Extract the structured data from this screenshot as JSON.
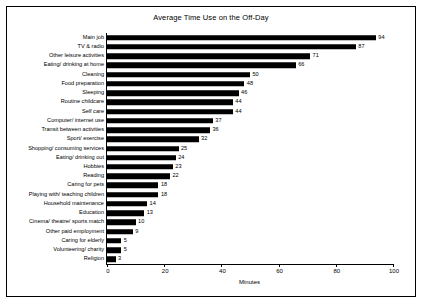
{
  "chart_data": {
    "type": "bar",
    "title": "Average Time Use on the Off-Day",
    "xlabel": "Minutes",
    "ylabel": "",
    "orientation": "horizontal",
    "xlim": [
      0,
      100
    ],
    "xticks": [
      0,
      20,
      40,
      60,
      80,
      100
    ],
    "grid": false,
    "categories": [
      "Main job",
      "TV & radio",
      "Other leisure activities",
      "Eating/ drinking at home",
      "Cleaning",
      "Food preparation",
      "Sleeping",
      "Routine childcare",
      "Self care",
      "Computer/ internet use",
      "Transit between activities",
      "Sport/ exercise",
      "Shopping/ consuming services",
      "Eating/ drinking out",
      "Hobbies",
      "Reading",
      "Caring for pets",
      "Playing with/ teaching children",
      "Household maintenance",
      "Education",
      "Cinema/ theatre/ sports match",
      "Other paid employment",
      "Caring for elderly",
      "Volunteering/ charity",
      "Religion"
    ],
    "values": [
      94,
      87,
      71,
      66,
      50,
      48,
      46,
      44,
      44,
      37,
      36,
      32,
      25,
      24,
      23,
      22,
      18,
      18,
      14,
      13,
      10,
      9,
      5,
      5,
      3
    ]
  }
}
